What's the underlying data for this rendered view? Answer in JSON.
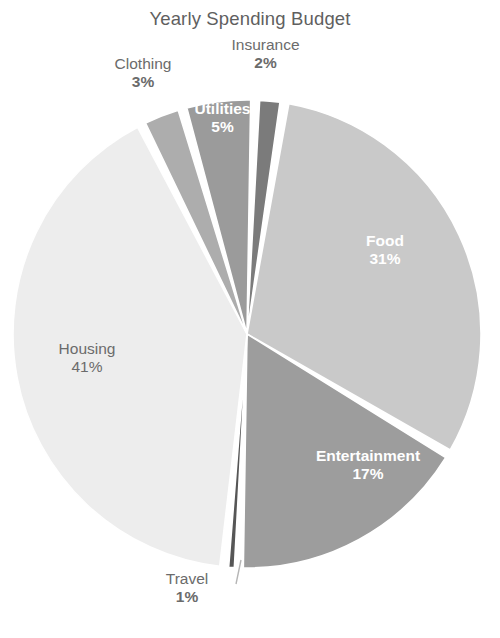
{
  "chart_data": {
    "type": "pie",
    "title": "Yearly Spending Budget",
    "xlabel": "",
    "ylabel": "",
    "legend": "none",
    "grid": false,
    "value_unit": "%",
    "start_angle_deg": -88,
    "direction": "clockwise",
    "categories": [
      "Insurance",
      "Food",
      "Entertainment",
      "Travel",
      "Housing",
      "Clothing",
      "Utilities"
    ],
    "values": [
      2,
      31,
      17,
      1,
      41,
      3,
      5
    ],
    "slices": [
      {
        "name": "Insurance",
        "label": "Insurance",
        "percent": 2,
        "percent_text": "2%",
        "color": "#7b7b7b",
        "label_placement": "outside",
        "label_style": "dark"
      },
      {
        "name": "Food",
        "label": "Food",
        "percent": 31,
        "percent_text": "31%",
        "color": "#c9c9c9",
        "label_placement": "inside",
        "label_style": "white"
      },
      {
        "name": "Entertainment",
        "label": "Entertainment",
        "percent": 17,
        "percent_text": "17%",
        "color": "#9d9d9d",
        "label_placement": "inside",
        "label_style": "white"
      },
      {
        "name": "Travel",
        "label": "Travel",
        "percent": 1,
        "percent_text": "1%",
        "color": "#565656",
        "label_placement": "outside",
        "label_style": "dark"
      },
      {
        "name": "Housing",
        "label": "Housing",
        "percent": 41,
        "percent_text": "41%",
        "color": "#ededed",
        "label_placement": "inside",
        "label_style": "dark"
      },
      {
        "name": "Clothing",
        "label": "Clothing",
        "percent": 3,
        "percent_text": "3%",
        "color": "#adadad",
        "label_placement": "outside",
        "label_style": "dark"
      },
      {
        "name": "Utilities",
        "label": "Utilities",
        "percent": 5,
        "percent_text": "5%",
        "color": "#9b9b9b",
        "label_placement": "inside",
        "label_style": "white"
      }
    ]
  },
  "colors": {
    "background": "#ffffff",
    "title_text": "#5f5f5f",
    "outside_label_text": "#6b6b6b",
    "inside_label_text": "#ffffff",
    "slice_separator": "#ffffff",
    "leader_line": "#b5b5b5"
  }
}
